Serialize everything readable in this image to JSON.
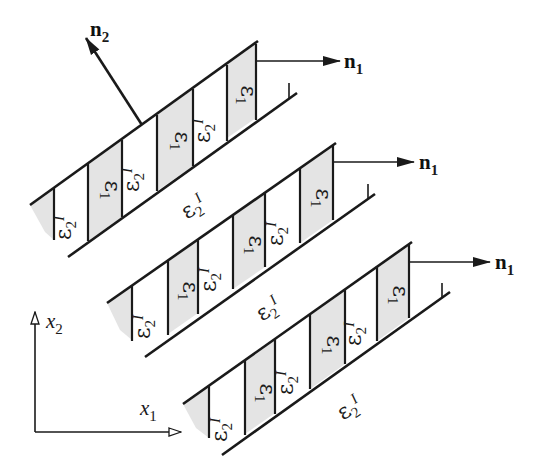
{
  "figure": {
    "colors": {
      "ink": "#1a1a1a",
      "shaded_layer": "#e4e4e4",
      "background": "#ffffff"
    }
  },
  "labels": {
    "eps1": "ε",
    "eps1_sub": "1",
    "eps2": "ε",
    "eps2_sub": "2",
    "eps2_sup": "I",
    "n1": "n",
    "n1_sub": "1",
    "n2": "n",
    "n2_sub": "2",
    "x1": "x",
    "x1_sub": "1",
    "x2": "x",
    "x2_sub": "2"
  },
  "strips": [
    {
      "name": "strip-top",
      "layers": [
        "ε2I",
        "ε1",
        "ε2I",
        "ε1",
        "ε2I",
        "ε1"
      ],
      "normal": "n1"
    },
    {
      "name": "strip-middle",
      "layers": [
        "ε2I",
        "ε1",
        "ε2I",
        "ε1",
        "ε2I",
        "ε1"
      ],
      "normal": "n1"
    },
    {
      "name": "strip-bottom",
      "layers": [
        "ε2I",
        "ε1",
        "ε2I",
        "ε1",
        "ε2I",
        "ε1"
      ],
      "normal": "n1"
    }
  ],
  "matrix_bands": [
    {
      "name": "band-between-top-middle",
      "phase": "ε2I"
    },
    {
      "name": "band-between-middle-bottom",
      "phase": "ε2I"
    },
    {
      "name": "band-below-bottom",
      "phase": "ε2I"
    }
  ],
  "vectors": [
    {
      "name": "n2",
      "direction": "normal to strip planes"
    },
    {
      "name": "n1",
      "direction": "normal to layer interfaces (horizontal)"
    }
  ],
  "axes": {
    "horizontal": "x1",
    "vertical": "x2"
  }
}
